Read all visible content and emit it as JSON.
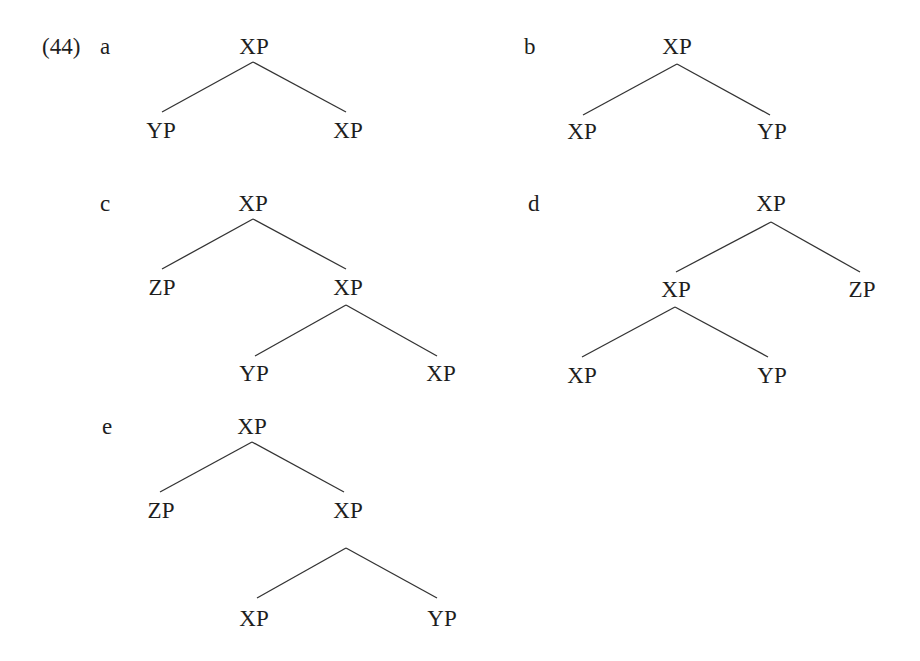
{
  "example_number": "(44)",
  "colors": {
    "text": "#1e1e1e",
    "edge": "#333333",
    "background": "#ffffff"
  },
  "trees": [
    {
      "label": "a",
      "label_pos": [
        100,
        35
      ],
      "nodes": [
        {
          "id": "root",
          "text": "XP",
          "x": 254,
          "y": 35
        },
        {
          "id": "l",
          "text": "YP",
          "x": 161,
          "y": 119
        },
        {
          "id": "r",
          "text": "XP",
          "x": 348,
          "y": 119
        }
      ],
      "edges": [
        {
          "from": [
            253,
            62
          ],
          "to": [
            162,
            112
          ]
        },
        {
          "from": [
            253,
            62
          ],
          "to": [
            346,
            112
          ]
        }
      ]
    },
    {
      "label": "b",
      "label_pos": [
        524,
        35
      ],
      "nodes": [
        {
          "id": "root",
          "text": "XP",
          "x": 677,
          "y": 35
        },
        {
          "id": "l",
          "text": "XP",
          "x": 582,
          "y": 120
        },
        {
          "id": "r",
          "text": "YP",
          "x": 772,
          "y": 120
        }
      ],
      "edges": [
        {
          "from": [
            677,
            64
          ],
          "to": [
            583,
            115
          ]
        },
        {
          "from": [
            677,
            64
          ],
          "to": [
            770,
            115
          ]
        }
      ]
    },
    {
      "label": "c",
      "label_pos": [
        100,
        192
      ],
      "nodes": [
        {
          "id": "root",
          "text": "XP",
          "x": 253,
          "y": 192
        },
        {
          "id": "l",
          "text": "ZP",
          "x": 162,
          "y": 276
        },
        {
          "id": "r",
          "text": "XP",
          "x": 348,
          "y": 276
        },
        {
          "id": "rl",
          "text": "YP",
          "x": 254,
          "y": 362
        },
        {
          "id": "rr",
          "text": "XP",
          "x": 441,
          "y": 362
        }
      ],
      "edges": [
        {
          "from": [
            253,
            219
          ],
          "to": [
            162,
            269
          ]
        },
        {
          "from": [
            253,
            219
          ],
          "to": [
            346,
            269
          ]
        },
        {
          "from": [
            346,
            305
          ],
          "to": [
            255,
            356
          ]
        },
        {
          "from": [
            346,
            305
          ],
          "to": [
            437,
            356
          ]
        }
      ]
    },
    {
      "label": "d",
      "label_pos": [
        528,
        192
      ],
      "nodes": [
        {
          "id": "root",
          "text": "XP",
          "x": 771,
          "y": 192
        },
        {
          "id": "l",
          "text": "XP",
          "x": 676,
          "y": 278
        },
        {
          "id": "r",
          "text": "ZP",
          "x": 862,
          "y": 278
        },
        {
          "id": "ll",
          "text": "XP",
          "x": 582,
          "y": 364
        },
        {
          "id": "lr",
          "text": "YP",
          "x": 772,
          "y": 364
        }
      ],
      "edges": [
        {
          "from": [
            771,
            222
          ],
          "to": [
            676,
            272
          ]
        },
        {
          "from": [
            771,
            222
          ],
          "to": [
            860,
            272
          ]
        },
        {
          "from": [
            675,
            307
          ],
          "to": [
            582,
            357
          ]
        },
        {
          "from": [
            675,
            307
          ],
          "to": [
            768,
            357
          ]
        }
      ]
    },
    {
      "label": "e",
      "label_pos": [
        102,
        415
      ],
      "nodes": [
        {
          "id": "root",
          "text": "XP",
          "x": 252,
          "y": 415
        },
        {
          "id": "l",
          "text": "ZP",
          "x": 161,
          "y": 499
        },
        {
          "id": "r",
          "text": "XP",
          "x": 348,
          "y": 499
        },
        {
          "id": "rl",
          "text": "XP",
          "x": 254,
          "y": 607
        },
        {
          "id": "rr",
          "text": "YP",
          "x": 442,
          "y": 607
        }
      ],
      "edges": [
        {
          "from": [
            252,
            442
          ],
          "to": [
            160,
            492
          ]
        },
        {
          "from": [
            252,
            442
          ],
          "to": [
            344,
            492
          ]
        },
        {
          "from": [
            346,
            548
          ],
          "to": [
            257,
            598
          ]
        },
        {
          "from": [
            346,
            548
          ],
          "to": [
            437,
            598
          ]
        }
      ]
    }
  ]
}
